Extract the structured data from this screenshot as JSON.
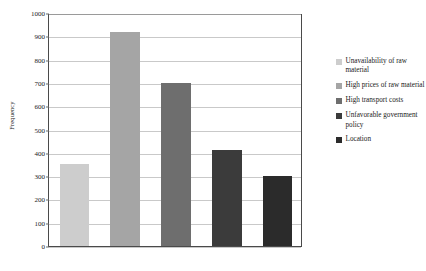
{
  "chart_data": {
    "type": "bar",
    "title": "",
    "xlabel": "",
    "ylabel": "Frequency",
    "ylim": [
      0,
      1000
    ],
    "ytick_step": 100,
    "yticks": [
      0,
      100,
      200,
      300,
      400,
      500,
      600,
      700,
      800,
      900,
      1000
    ],
    "grid": true,
    "legend_position": "right",
    "xtick_labels": [],
    "categories": [
      "Unavailability of raw material",
      "High prices of raw material",
      "High transport costs",
      "Unfavorable government policy",
      "Location"
    ],
    "values": [
      350,
      920,
      700,
      410,
      300
    ],
    "colors": [
      "#cdcdcd",
      "#a5a5a5",
      "#6e6e6e",
      "#3b3b3b",
      "#2b2b2b"
    ]
  },
  "legend": {
    "items": [
      {
        "label": "Unavailability of raw material",
        "color": "#cdcdcd"
      },
      {
        "label": "High prices of raw material",
        "color": "#a5a5a5"
      },
      {
        "label": "High transport costs",
        "color": "#6e6e6e"
      },
      {
        "label": "Unfavorable government policy",
        "color": "#3b3b3b"
      },
      {
        "label": "Location",
        "color": "#2b2b2b"
      }
    ]
  }
}
